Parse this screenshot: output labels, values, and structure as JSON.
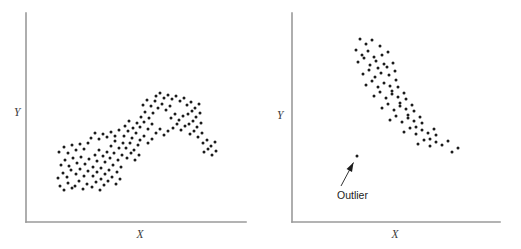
{
  "figure": {
    "background_color": "#ffffff",
    "dot_color": "#1b1b1b",
    "axis_color": "#9a9a9a",
    "annotation_color": "#1b1b1b",
    "dot_radius": 1.5,
    "width": 521,
    "height": 249
  },
  "panels": {
    "left": {
      "name": "curvilinear-scatterplot",
      "xlabel": "X",
      "ylabel": "Y",
      "axes": {
        "y_axis": {
          "x": 26,
          "y_top": 13,
          "y_bottom": 222
        },
        "x_axis": {
          "y": 222,
          "x_left": 26,
          "x_right": 246
        }
      },
      "label_positions": {
        "ylabel": {
          "x": 14,
          "y": 116
        },
        "xlabel": {
          "x": 140,
          "y": 238
        }
      }
    },
    "right": {
      "name": "negative-correlation-scatterplot-with-outlier",
      "xlabel": "X",
      "ylabel": "Y",
      "axes": {
        "y_axis": {
          "x": 292,
          "y_top": 13,
          "y_bottom": 222
        },
        "x_axis": {
          "y": 222,
          "x_left": 292,
          "x_right": 500
        }
      },
      "label_positions": {
        "ylabel": {
          "x": 277,
          "y": 119
        },
        "xlabel": {
          "x": 395,
          "y": 238
        }
      },
      "annotation": {
        "text": "Outlier",
        "text_x": 337,
        "text_y": 199,
        "arrow_tail_x": 341,
        "arrow_tail_y": 186,
        "arrow_tip_x": 353.5,
        "arrow_tip_y": 162.5
      }
    }
  },
  "chart_data": [
    {
      "type": "scatter",
      "title": "",
      "panel": "left",
      "xlabel": "X",
      "ylabel": "Y",
      "description": "Curvilinear (inverted-U) relationship between X and Y",
      "grid": false,
      "legend": false,
      "xlim": [
        26,
        246
      ],
      "ylim": [
        222,
        13
      ],
      "n_points": 152,
      "points": [
        [
          60,
          186
        ],
        [
          64,
          190
        ],
        [
          68,
          183
        ],
        [
          72,
          188
        ],
        [
          58,
          178
        ],
        [
          63,
          173
        ],
        [
          67,
          177
        ],
        [
          71,
          170
        ],
        [
          75,
          186
        ],
        [
          79,
          181
        ],
        [
          83,
          189
        ],
        [
          87,
          184
        ],
        [
          76,
          174
        ],
        [
          80,
          169
        ],
        [
          84,
          176
        ],
        [
          88,
          171
        ],
        [
          61,
          165
        ],
        [
          65,
          160
        ],
        [
          69,
          166
        ],
        [
          73,
          158
        ],
        [
          77,
          163
        ],
        [
          81,
          157
        ],
        [
          85,
          164
        ],
        [
          89,
          159
        ],
        [
          92,
          187
        ],
        [
          96,
          182
        ],
        [
          100,
          190
        ],
        [
          104,
          185
        ],
        [
          93,
          176
        ],
        [
          97,
          172
        ],
        [
          101,
          179
        ],
        [
          105,
          174
        ],
        [
          93,
          167
        ],
        [
          97,
          161
        ],
        [
          101,
          168
        ],
        [
          105,
          162
        ],
        [
          95,
          155
        ],
        [
          99,
          150
        ],
        [
          103,
          156
        ],
        [
          107,
          152
        ],
        [
          59,
          152
        ],
        [
          64,
          147
        ],
        [
          68,
          153
        ],
        [
          72,
          145
        ],
        [
          76,
          150
        ],
        [
          80,
          144
        ],
        [
          84,
          149
        ],
        [
          88,
          143
        ],
        [
          108,
          181
        ],
        [
          112,
          177
        ],
        [
          116,
          184
        ],
        [
          120,
          179
        ],
        [
          109,
          170
        ],
        [
          113,
          165
        ],
        [
          117,
          172
        ],
        [
          121,
          167
        ],
        [
          110,
          158
        ],
        [
          114,
          153
        ],
        [
          118,
          160
        ],
        [
          122,
          155
        ],
        [
          111,
          146
        ],
        [
          115,
          141
        ],
        [
          119,
          148
        ],
        [
          123,
          143
        ],
        [
          91,
          138
        ],
        [
          95,
          133
        ],
        [
          99,
          139
        ],
        [
          103,
          134
        ],
        [
          107,
          137
        ],
        [
          111,
          132
        ],
        [
          115,
          136
        ],
        [
          119,
          130
        ],
        [
          124,
          136
        ],
        [
          128,
          131
        ],
        [
          132,
          138
        ],
        [
          136,
          133
        ],
        [
          125,
          126
        ],
        [
          129,
          121
        ],
        [
          133,
          128
        ],
        [
          137,
          123
        ],
        [
          126,
          148
        ],
        [
          130,
          143
        ],
        [
          134,
          150
        ],
        [
          138,
          145
        ],
        [
          127,
          158
        ],
        [
          131,
          153
        ],
        [
          135,
          160
        ],
        [
          139,
          155
        ],
        [
          140,
          127
        ],
        [
          144,
          122
        ],
        [
          148,
          129
        ],
        [
          152,
          124
        ],
        [
          141,
          117
        ],
        [
          145,
          112
        ],
        [
          149,
          118
        ],
        [
          153,
          113
        ],
        [
          143,
          105
        ],
        [
          147,
          100
        ],
        [
          151,
          106
        ],
        [
          155,
          101
        ],
        [
          156,
          96
        ],
        [
          160,
          93
        ],
        [
          164,
          98
        ],
        [
          168,
          95
        ],
        [
          140,
          140
        ],
        [
          144,
          136
        ],
        [
          148,
          143
        ],
        [
          152,
          139
        ],
        [
          156,
          133
        ],
        [
          160,
          129
        ],
        [
          164,
          135
        ],
        [
          168,
          131
        ],
        [
          158,
          108
        ],
        [
          162,
          104
        ],
        [
          166,
          110
        ],
        [
          170,
          106
        ],
        [
          172,
          99
        ],
        [
          176,
          96
        ],
        [
          180,
          101
        ],
        [
          184,
          98
        ],
        [
          171,
          118
        ],
        [
          175,
          114
        ],
        [
          179,
          120
        ],
        [
          183,
          116
        ],
        [
          173,
          128
        ],
        [
          177,
          124
        ],
        [
          181,
          130
        ],
        [
          185,
          126
        ],
        [
          187,
          105
        ],
        [
          191,
          102
        ],
        [
          195,
          108
        ],
        [
          199,
          104
        ],
        [
          188,
          114
        ],
        [
          192,
          111
        ],
        [
          196,
          117
        ],
        [
          200,
          113
        ],
        [
          189,
          124
        ],
        [
          193,
          121
        ],
        [
          197,
          127
        ],
        [
          201,
          123
        ],
        [
          190,
          134
        ],
        [
          194,
          131
        ],
        [
          198,
          137
        ],
        [
          202,
          133
        ],
        [
          203,
          143
        ],
        [
          207,
          140
        ],
        [
          211,
          146
        ],
        [
          215,
          142
        ],
        [
          204,
          152
        ],
        [
          208,
          149
        ],
        [
          212,
          155
        ],
        [
          216,
          151
        ]
      ]
    },
    {
      "type": "scatter",
      "title": "",
      "panel": "right",
      "xlabel": "X",
      "ylabel": "Y",
      "description": "Negative linear relationship between X and Y with one low-left outlier",
      "grid": false,
      "legend": false,
      "xlim": [
        292,
        500
      ],
      "ylim": [
        222,
        13
      ],
      "n_points": 72,
      "points": [
        [
          360,
          39
        ],
        [
          366,
          44
        ],
        [
          372,
          40
        ],
        [
          356,
          50
        ],
        [
          362,
          55
        ],
        [
          368,
          51
        ],
        [
          374,
          57
        ],
        [
          380,
          46
        ],
        [
          358,
          62
        ],
        [
          364,
          58
        ],
        [
          370,
          65
        ],
        [
          376,
          61
        ],
        [
          382,
          55
        ],
        [
          388,
          52
        ],
        [
          378,
          68
        ],
        [
          384,
          64
        ],
        [
          363,
          74
        ],
        [
          369,
          70
        ],
        [
          375,
          77
        ],
        [
          381,
          73
        ],
        [
          387,
          67
        ],
        [
          393,
          63
        ],
        [
          389,
          75
        ],
        [
          395,
          71
        ],
        [
          366,
          85
        ],
        [
          372,
          81
        ],
        [
          378,
          87
        ],
        [
          384,
          83
        ],
        [
          390,
          86
        ],
        [
          396,
          80
        ],
        [
          392,
          91
        ],
        [
          398,
          87
        ],
        [
          374,
          96
        ],
        [
          380,
          92
        ],
        [
          386,
          98
        ],
        [
          392,
          94
        ],
        [
          398,
          97
        ],
        [
          404,
          93
        ],
        [
          400,
          103
        ],
        [
          406,
          99
        ],
        [
          382,
          108
        ],
        [
          388,
          104
        ],
        [
          394,
          110
        ],
        [
          400,
          106
        ],
        [
          406,
          109
        ],
        [
          412,
          105
        ],
        [
          408,
          115
        ],
        [
          414,
          111
        ],
        [
          390,
          120
        ],
        [
          396,
          116
        ],
        [
          402,
          122
        ],
        [
          408,
          118
        ],
        [
          414,
          121
        ],
        [
          420,
          117
        ],
        [
          416,
          127
        ],
        [
          422,
          123
        ],
        [
          404,
          132
        ],
        [
          410,
          128
        ],
        [
          416,
          134
        ],
        [
          422,
          130
        ],
        [
          428,
          133
        ],
        [
          434,
          129
        ],
        [
          430,
          139
        ],
        [
          436,
          135
        ],
        [
          418,
          144
        ],
        [
          424,
          140
        ],
        [
          430,
          146
        ],
        [
          436,
          142
        ],
        [
          442,
          145
        ],
        [
          448,
          141
        ],
        [
          452,
          152
        ],
        [
          458,
          148
        ]
      ],
      "outlier": {
        "x": 357,
        "y": 156,
        "label": "Outlier"
      }
    }
  ]
}
